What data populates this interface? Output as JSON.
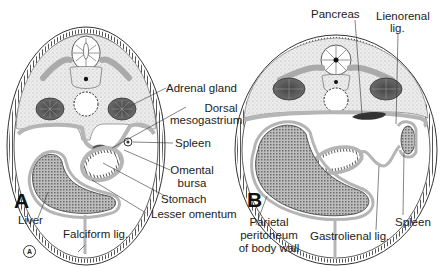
{
  "figure": {
    "panels": [
      {
        "id": "A",
        "label": "A",
        "labels": {
          "adrenal_gland": "Adrenal gland",
          "dorsal_mesogastrium_1": "Dorsal",
          "dorsal_mesogastrium_2": "mesogastrium",
          "spleen": "Spleen",
          "omental_bursa_1": "Omental",
          "omental_bursa_2": "bursa",
          "stomach": "Stomach",
          "lesser_omentum": "Lesser omentum",
          "liver": "Liver",
          "falciform_lig": "Falciform lig."
        }
      },
      {
        "id": "B",
        "label": "B",
        "labels": {
          "pancreas": "Pancreas",
          "lienorenal_1": "Lienorenal",
          "lienorenal_2": "lig.",
          "parietal_1": "Parietal",
          "parietal_2": "peritoneum",
          "parietal_3": "of body wall",
          "gastrolienal_lig": "Gastrolienal lig.",
          "spleen": "Spleen"
        }
      }
    ],
    "corner_mark": "A",
    "colors": {
      "outline": "#333333",
      "stipple": "#d9d9d9",
      "peritoneum": "#b5b5b5",
      "organ_fill": "#8f8f8f",
      "background": "#ffffff"
    }
  }
}
